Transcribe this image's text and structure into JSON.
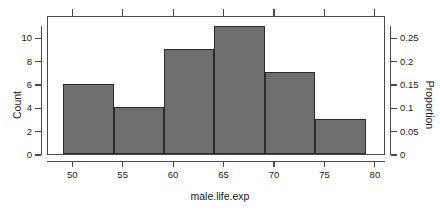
{
  "chart_data": {
    "type": "bar",
    "title": "",
    "subtitle": "",
    "xlabel": "male.life.exp",
    "ylabel": "Count",
    "y2label": "Proportion",
    "bin_width": 5,
    "bin_edges": [
      49,
      54,
      59,
      64,
      69,
      74,
      79
    ],
    "categories": [
      "49-54",
      "54-59",
      "59-64",
      "64-69",
      "69-74",
      "74-79"
    ],
    "values": [
      6,
      4,
      9,
      11,
      7,
      3
    ],
    "total_count": 40,
    "proportions": [
      0.15,
      0.1,
      0.225,
      0.275,
      0.175,
      0.075
    ],
    "xlim": [
      47.5,
      81
    ],
    "ylim": [
      0,
      11.9
    ],
    "y2lim": [
      0,
      0.2975
    ],
    "xticks": [
      50,
      55,
      60,
      65,
      70,
      75,
      80
    ],
    "xtick_labels": [
      "50",
      "55",
      "60",
      "65",
      "70",
      "75",
      "80"
    ],
    "yticks": [
      0,
      2,
      4,
      6,
      8,
      10
    ],
    "ytick_labels": [
      "0",
      "2",
      "4",
      "6",
      "8",
      "10"
    ],
    "y2ticks": [
      0,
      0.05,
      0.1,
      0.15,
      0.2,
      0.25
    ],
    "y2tick_labels": [
      "0",
      "0.05",
      "0.1",
      "0.15",
      "0.2",
      "0.25"
    ],
    "grid": false,
    "legend": false,
    "bar_fill": "#6e6e6e",
    "bar_border": "#2b2b2b",
    "axis_color": "#4a4a4a",
    "background": "#ffffff"
  }
}
